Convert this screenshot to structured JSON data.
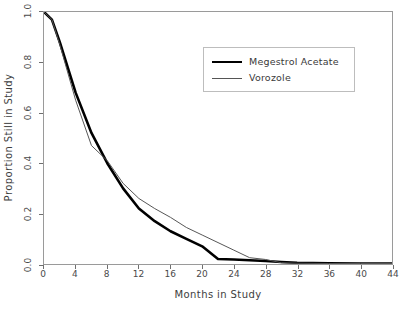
{
  "chart_data": {
    "type": "line",
    "title": "",
    "xlabel": "Months in Study",
    "ylabel": "Proportion Still in Study",
    "xlim": [
      0,
      44
    ],
    "ylim": [
      0.0,
      1.0
    ],
    "xticks": [
      "0",
      "4",
      "8",
      "12",
      "16",
      "20",
      "24",
      "28",
      "32",
      "36",
      "40",
      "44"
    ],
    "yticks": [
      "0.0",
      "0.2",
      "0.4",
      "0.6",
      "0.8",
      "1.0"
    ],
    "grid": false,
    "legend_position": "upper center",
    "series": [
      {
        "name": "Megestrol Acetate",
        "color": "#000000",
        "line_width": 2.6,
        "x": [
          0,
          1,
          2,
          4,
          6,
          8,
          10,
          12,
          14,
          16,
          18,
          20,
          22,
          24,
          26,
          28,
          30,
          32,
          36,
          40,
          44
        ],
        "values": [
          1.0,
          0.97,
          0.88,
          0.68,
          0.52,
          0.4,
          0.3,
          0.22,
          0.17,
          0.13,
          0.1,
          0.07,
          0.02,
          0.018,
          0.015,
          0.012,
          0.008,
          0.005,
          0.003,
          0.002,
          0.002
        ]
      },
      {
        "name": "Vorozole",
        "color": "#555555",
        "line_width": 1.0,
        "x": [
          0,
          1,
          2,
          4,
          6,
          8,
          10,
          12,
          14,
          16,
          18,
          20,
          22,
          24,
          26,
          28,
          30,
          32,
          36,
          40,
          44
        ],
        "values": [
          1.0,
          0.97,
          0.87,
          0.65,
          0.47,
          0.41,
          0.32,
          0.26,
          0.22,
          0.185,
          0.145,
          0.115,
          0.085,
          0.055,
          0.025,
          0.018,
          0.005,
          0.003,
          0.002,
          0.002,
          0.002
        ]
      }
    ]
  },
  "legend": {
    "items": [
      {
        "label": "Megestrol Acetate",
        "style": "thick"
      },
      {
        "label": "Vorozole",
        "style": "thin"
      }
    ]
  }
}
